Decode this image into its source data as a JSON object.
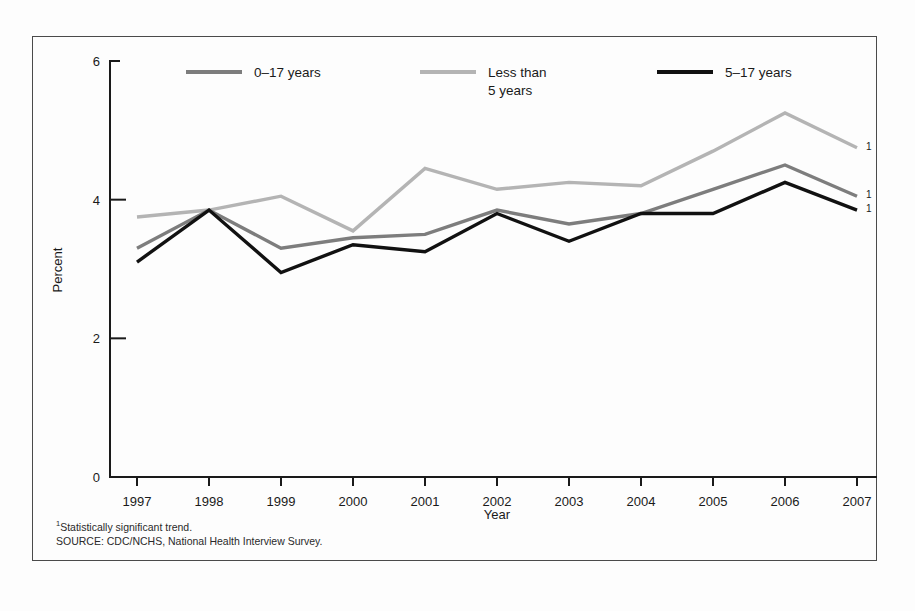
{
  "chart_data": {
    "type": "line",
    "title": "",
    "xlabel": "Year",
    "ylabel": "Percent",
    "categories": [
      "1997",
      "1998",
      "1999",
      "2000",
      "2001",
      "2002",
      "2003",
      "2004",
      "2005",
      "2006",
      "2007"
    ],
    "x": [
      1997,
      1998,
      1999,
      2000,
      2001,
      2002,
      2003,
      2004,
      2005,
      2006,
      2007
    ],
    "ylim": [
      0,
      6
    ],
    "yticks": [
      "0",
      "2",
      "4",
      "6"
    ],
    "ytick_values": [
      0,
      2,
      4,
      6
    ],
    "xlim": [
      1997,
      2007
    ],
    "grid": false,
    "legend_position": "top",
    "series": [
      {
        "name": "0–17 years",
        "color": "#7d7d7d",
        "values": [
          3.3,
          3.85,
          3.3,
          3.45,
          3.5,
          3.85,
          3.65,
          3.8,
          4.15,
          4.5,
          4.05
        ],
        "end_marker": "1"
      },
      {
        "name": "Less than 5 years",
        "color": "#b4b4b4",
        "values": [
          3.75,
          3.85,
          4.05,
          3.55,
          4.45,
          4.15,
          4.25,
          4.2,
          4.7,
          5.25,
          4.75
        ],
        "end_marker": "1"
      },
      {
        "name": "5–17 years",
        "color": "#111111",
        "values": [
          3.1,
          3.85,
          2.95,
          3.35,
          3.25,
          3.8,
          3.4,
          3.8,
          3.8,
          4.25,
          3.85
        ],
        "end_marker": "1"
      }
    ]
  },
  "legend": {
    "entries": [
      {
        "label": "0–17 years",
        "label_line1": "0–17 years",
        "label_line2": "",
        "color": "#7d7d7d"
      },
      {
        "label": "Less than 5 years",
        "label_line1": "Less than",
        "label_line2": "5 years",
        "color": "#b4b4b4"
      },
      {
        "label": "5–17 years",
        "label_line1": "5–17 years",
        "label_line2": "",
        "color": "#111111"
      }
    ]
  },
  "axes": {
    "y_title": "Percent",
    "x_title": "Year"
  },
  "footnotes": {
    "marker": "1",
    "note": "Statistically significant trend.",
    "source": "SOURCE: CDC/NCHS, National Health Interview Survey."
  }
}
